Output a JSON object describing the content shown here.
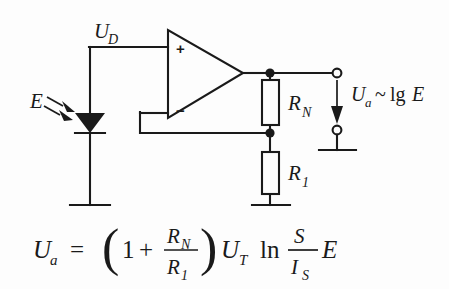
{
  "figure": {
    "background_color": "#fdfdfd",
    "line_color": "#1a1a1a"
  },
  "labels": {
    "diff_voltage": "U",
    "diff_voltage_sub": "D",
    "irradiance": "E",
    "resistor_feedback": "R",
    "resistor_feedback_sub": "N",
    "resistor_ground": "R",
    "resistor_ground_sub": "1",
    "output_u": "U",
    "output_u_sub": "a",
    "output_relation": "~",
    "output_log": "lg",
    "output_arg": "E",
    "opamp_plus": "+",
    "opamp_minus": "−"
  },
  "equation": {
    "lhs": "U",
    "lhs_sub": "a",
    "equals": "=",
    "paren_open": "(",
    "one": "1",
    "plus": "+",
    "frac1_num": "R",
    "frac1_num_sub": "N",
    "frac1_den": "R",
    "frac1_den_sub": "1",
    "paren_close": ")",
    "ut": "U",
    "ut_sub": "T",
    "ln": "ln",
    "frac2_num": "S",
    "frac2_den": "I",
    "frac2_den_sub": "S",
    "tail": "E"
  },
  "components": {
    "photodiode": "photodiode",
    "opamp": "operational-amplifier",
    "ground_left": "ground",
    "ground_divider": "ground",
    "ground_output": "ground",
    "terminal_top": "output-terminal",
    "terminal_bottom": "output-terminal"
  }
}
